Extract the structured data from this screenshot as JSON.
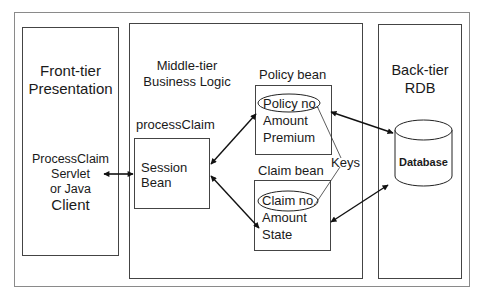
{
  "diagram": {
    "front_tier": {
      "title_line1": "Front-tier",
      "title_line2": "Presentation",
      "client_line1": "ProcessClaim",
      "client_line2": "Servlet",
      "client_line3": "or Java",
      "client_line4": "Client"
    },
    "middle_tier": {
      "title_line1": "Middle-tier",
      "title_line2": "Business Logic",
      "session": {
        "name": "processClaim",
        "line1": "Session",
        "line2": "Bean"
      },
      "policy_bean": {
        "name": "Policy bean",
        "key_field": "Policy no.",
        "field2": "Amount",
        "field3": "Premium"
      },
      "claim_bean": {
        "name": "Claim bean",
        "key_field": "Claim no.",
        "field2": "Amount",
        "field3": "State"
      },
      "keys_label": "Keys"
    },
    "back_tier": {
      "title_line1": "Back-tier",
      "title_line2": "RDB",
      "database_label": "Database"
    }
  }
}
